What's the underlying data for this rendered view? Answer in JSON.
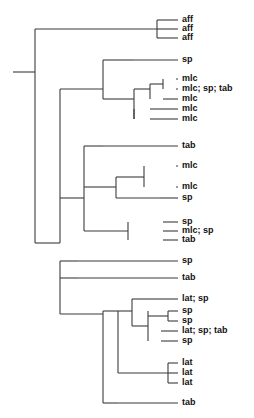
{
  "figure": {
    "type": "phylogenetic-cladogram",
    "orientation": "left-to-right",
    "background_color": "#ffffff",
    "branch_color": "#3b3b3b",
    "label_color": "#111111",
    "width": 254,
    "height": 418
  },
  "tips": [
    {
      "id": "t1",
      "label": "aff",
      "y": 20,
      "x_branch_start": 157
    },
    {
      "id": "t2",
      "label": "aff",
      "y": 29,
      "x_branch_start": 157
    },
    {
      "id": "t3",
      "label": "aff",
      "y": 38,
      "x_branch_start": 157
    },
    {
      "id": "t4",
      "label": "sp",
      "y": 60,
      "x_branch_start": 134
    },
    {
      "id": "t5",
      "label": "mlc",
      "y": 79,
      "x_branch_start": 176
    },
    {
      "id": "t6",
      "label": "mlc; sp; tab",
      "y": 89,
      "x_branch_start": 176
    },
    {
      "id": "t7",
      "label": "mlc",
      "y": 99,
      "x_branch_start": 163
    },
    {
      "id": "t8",
      "label": "mlc",
      "y": 109,
      "x_branch_start": 150
    },
    {
      "id": "t9",
      "label": "mlc",
      "y": 119,
      "x_branch_start": 150
    },
    {
      "id": "t10",
      "label": "tab",
      "y": 146,
      "x_branch_start": 103
    },
    {
      "id": "t11",
      "label": "mlc",
      "y": 166,
      "x_branch_start": 176
    },
    {
      "id": "t12",
      "label": "mlc",
      "y": 187,
      "x_branch_start": 176
    },
    {
      "id": "t13",
      "label": "sp",
      "y": 198,
      "x_branch_start": 160
    },
    {
      "id": "t14",
      "label": "sp",
      "y": 222,
      "x_branch_start": 163
    },
    {
      "id": "t15",
      "label": "mlc; sp",
      "y": 231,
      "x_branch_start": 163
    },
    {
      "id": "t16",
      "label": "tab",
      "y": 240,
      "x_branch_start": 163
    },
    {
      "id": "t17",
      "label": "sp",
      "y": 261,
      "x_branch_start": 78
    },
    {
      "id": "t18",
      "label": "tab",
      "y": 278,
      "x_branch_start": 78
    },
    {
      "id": "t19",
      "label": "lat; sp",
      "y": 299,
      "x_branch_start": 155
    },
    {
      "id": "t20",
      "label": "sp",
      "y": 311,
      "x_branch_start": 168
    },
    {
      "id": "t21",
      "label": "sp",
      "y": 321,
      "x_branch_start": 168
    },
    {
      "id": "t22",
      "label": "lat; sp; tab",
      "y": 331,
      "x_branch_start": 161
    },
    {
      "id": "t23",
      "label": "sp",
      "y": 341,
      "x_branch_start": 161
    },
    {
      "id": "t24",
      "label": "lat",
      "y": 363,
      "x_branch_start": 168
    },
    {
      "id": "t25",
      "label": "lat",
      "y": 373,
      "x_branch_start": 168
    },
    {
      "id": "t26",
      "label": "lat",
      "y": 383,
      "x_branch_start": 168
    },
    {
      "id": "t27",
      "label": "tab",
      "y": 403,
      "x_branch_start": 118
    }
  ],
  "label_x": 182,
  "tip_line_end": 178,
  "nodes": [
    {
      "id": "root_stem",
      "x1": 13,
      "y1": 72,
      "x2": 35,
      "y2": 72
    },
    {
      "id": "root_spine",
      "x1": 35,
      "y1": 29,
      "x2": 35,
      "y2": 243
    },
    {
      "id": "root_to_affclade",
      "x1": 35,
      "y1": 29,
      "x2": 157,
      "y2": 29
    },
    {
      "id": "aff_spine",
      "x1": 157,
      "y1": 20,
      "x2": 157,
      "y2": 38
    },
    {
      "id": "big_spine",
      "x1": 60,
      "y1": 89,
      "x2": 60,
      "y2": 243
    },
    {
      "id": "root_to_big",
      "x1": 35,
      "y1": 243,
      "x2": 60,
      "y2": 243
    },
    {
      "id": "clade_a_stem",
      "x1": 60,
      "y1": 89,
      "x2": 103,
      "y2": 89
    },
    {
      "id": "clade_a_spine",
      "x1": 103,
      "y1": 60,
      "x2": 103,
      "y2": 99
    },
    {
      "id": "clade_a_to_sp",
      "x1": 103,
      "y1": 60,
      "x2": 134,
      "y2": 60
    },
    {
      "id": "mlc_group_stem",
      "x1": 103,
      "y1": 99,
      "x2": 134,
      "y2": 99
    },
    {
      "id": "mlc_group_spine",
      "x1": 134,
      "y1": 89,
      "x2": 134,
      "y2": 119
    },
    {
      "id": "mlc_sub_stem",
      "x1": 134,
      "y1": 89,
      "x2": 150,
      "y2": 89
    },
    {
      "id": "mlc_sub_spine",
      "x1": 150,
      "y1": 84,
      "x2": 150,
      "y2": 99
    },
    {
      "id": "mlc_pair_stem",
      "x1": 150,
      "y1": 84,
      "x2": 163,
      "y2": 84
    },
    {
      "id": "mlc_pair_spine",
      "x1": 163,
      "y1": 79,
      "x2": 163,
      "y2": 89
    },
    {
      "id": "mlc_lower_spine",
      "x1": 134,
      "y1": 109,
      "x2": 134,
      "y2": 119
    },
    {
      "id": "clade_b_stem",
      "x1": 60,
      "y1": 198,
      "x2": 84,
      "y2": 198
    },
    {
      "id": "clade_b_spine",
      "x1": 84,
      "y1": 146,
      "x2": 84,
      "y2": 231
    },
    {
      "id": "clade_b_to_tab",
      "x1": 84,
      "y1": 146,
      "x2": 103,
      "y2": 146
    },
    {
      "id": "clade_c_stem",
      "x1": 84,
      "y1": 187,
      "x2": 116,
      "y2": 187
    },
    {
      "id": "clade_c_spine",
      "x1": 116,
      "y1": 177,
      "x2": 116,
      "y2": 198
    },
    {
      "id": "clade_c_upper",
      "x1": 116,
      "y1": 177,
      "x2": 144,
      "y2": 177
    },
    {
      "id": "clade_c_up_spine",
      "x1": 144,
      "y1": 166,
      "x2": 144,
      "y2": 187
    },
    {
      "id": "clade_c_to_sp",
      "x1": 116,
      "y1": 198,
      "x2": 160,
      "y2": 198
    },
    {
      "id": "clade_d_stem",
      "x1": 84,
      "y1": 231,
      "x2": 128,
      "y2": 231
    },
    {
      "id": "clade_d_spine",
      "x1": 128,
      "y1": 222,
      "x2": 128,
      "y2": 240
    },
    {
      "id": "lower_spine",
      "x1": 60,
      "y1": 261,
      "x2": 60,
      "y2": 314
    },
    {
      "id": "lower_to_sp",
      "x1": 60,
      "y1": 261,
      "x2": 78,
      "y2": 261
    },
    {
      "id": "lower_to_tab",
      "x1": 60,
      "y1": 278,
      "x2": 78,
      "y2": 278
    },
    {
      "id": "clade_e_stem",
      "x1": 60,
      "y1": 314,
      "x2": 103,
      "y2": 314
    },
    {
      "id": "clade_e_spine",
      "x1": 103,
      "y1": 311,
      "x2": 103,
      "y2": 403
    },
    {
      "id": "clade_e_to_tab",
      "x1": 103,
      "y1": 403,
      "x2": 118,
      "y2": 403
    },
    {
      "id": "clade_f_stem",
      "x1": 103,
      "y1": 311,
      "x2": 118,
      "y2": 311
    },
    {
      "id": "clade_f_spine",
      "x1": 118,
      "y1": 311,
      "x2": 118,
      "y2": 373
    },
    {
      "id": "clade_lat_sp_stem",
      "x1": 118,
      "y1": 311,
      "x2": 132,
      "y2": 311
    },
    {
      "id": "clade_lat_sp_spine",
      "x1": 132,
      "y1": 299,
      "x2": 132,
      "y2": 326
    },
    {
      "id": "lat_sp_upper",
      "x1": 132,
      "y1": 299,
      "x2": 155,
      "y2": 299
    },
    {
      "id": "lat_sp_lower_stem",
      "x1": 132,
      "y1": 326,
      "x2": 148,
      "y2": 326
    },
    {
      "id": "lat_sp_lower_spine",
      "x1": 148,
      "y1": 311,
      "x2": 148,
      "y2": 341
    },
    {
      "id": "lat_sp_pair_spine",
      "x1": 168,
      "y1": 311,
      "x2": 168,
      "y2": 321
    },
    {
      "id": "lat_sp_pair_stem",
      "x1": 148,
      "y1": 316,
      "x2": 168,
      "y2": 316
    },
    {
      "id": "lat_trio_stem",
      "x1": 118,
      "y1": 373,
      "x2": 168,
      "y2": 373
    },
    {
      "id": "lat_trio_spine",
      "x1": 168,
      "y1": 363,
      "x2": 168,
      "y2": 383
    }
  ]
}
